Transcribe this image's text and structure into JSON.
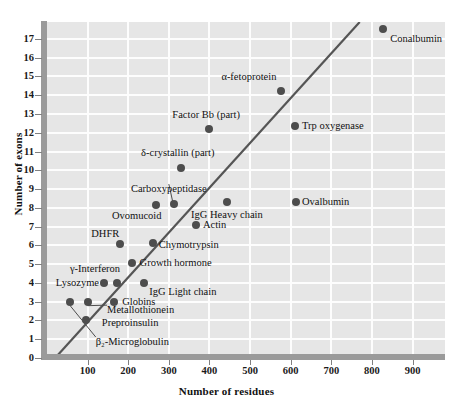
{
  "chart_data": {
    "type": "scatter",
    "title": "",
    "xlabel": "Number of residues",
    "ylabel": "Number of exons",
    "xlim": [
      0,
      980
    ],
    "ylim": [
      0,
      17.9
    ],
    "xticks": [
      100,
      200,
      300,
      400,
      500,
      600,
      700,
      800,
      900
    ],
    "yticks": [
      0,
      1,
      2,
      3,
      4,
      5,
      6,
      7,
      8,
      9,
      10,
      11,
      12,
      13,
      14,
      15,
      16,
      17
    ],
    "grid": true,
    "legend": "none",
    "trendline": {
      "label": "regression line",
      "x0": 20,
      "y0": 0,
      "x1": 770,
      "y1": 17.9
    },
    "points": [
      {
        "name": "β₂-Microglobulin",
        "x": 57,
        "y": 3.0,
        "label_x": 120,
        "label_y": 0.85,
        "anchor": "left",
        "leader": true
      },
      {
        "name": "Preproinsulin",
        "x": 95,
        "y": 2.0,
        "label_x": 135,
        "label_y": 1.85,
        "anchor": "left",
        "leader": false
      },
      {
        "name": "Metallothionein",
        "x": 100,
        "y": 3.0,
        "label_x": 148,
        "label_y": 2.55,
        "anchor": "left",
        "leader": true
      },
      {
        "name": "Globins",
        "x": 165,
        "y": 3.0,
        "label_x": 185,
        "label_y": 3.0,
        "anchor": "left",
        "leader": false
      },
      {
        "name": "Lysozyme",
        "x": 140,
        "y": 4.0,
        "label_x": 128,
        "label_y": 4.0,
        "anchor": "right",
        "leader": false
      },
      {
        "name": "γ-Interferon",
        "x": 172,
        "y": 4.0,
        "label_x": 180,
        "label_y": 4.72,
        "anchor": "right",
        "leader": false
      },
      {
        "name": "IgG Light chain",
        "x": 240,
        "y": 4.0,
        "label_x": 252,
        "label_y": 3.5,
        "anchor": "left",
        "leader": false
      },
      {
        "name": "Growth hormone",
        "x": 210,
        "y": 5.05,
        "label_x": 228,
        "label_y": 5.05,
        "anchor": "left",
        "leader": false
      },
      {
        "name": "DHFR",
        "x": 180,
        "y": 6.05,
        "label_x": 178,
        "label_y": 6.6,
        "anchor": "right",
        "leader": false
      },
      {
        "name": "Chymotrypsin",
        "x": 260,
        "y": 6.1,
        "label_x": 275,
        "label_y": 6.0,
        "anchor": "left",
        "leader": false
      },
      {
        "name": "Actin",
        "x": 368,
        "y": 7.1,
        "label_x": 384,
        "label_y": 7.1,
        "anchor": "left",
        "leader": false
      },
      {
        "name": "Ovomucoid",
        "x": 268,
        "y": 8.15,
        "label_x": 282,
        "label_y": 7.55,
        "anchor": "right",
        "leader": false
      },
      {
        "name": "Carboxypeptidase",
        "x": 313,
        "y": 8.2,
        "label_x": 300,
        "label_y": 9.0,
        "anchor": "center",
        "leader": true
      },
      {
        "name": "IgG Heavy chain",
        "x": 443,
        "y": 8.3,
        "label_x": 443,
        "label_y": 7.6,
        "anchor": "center",
        "leader": false
      },
      {
        "name": "Ovalbumin",
        "x": 612,
        "y": 8.3,
        "label_x": 628,
        "label_y": 8.3,
        "anchor": "left",
        "leader": false
      },
      {
        "name": "δ-crystallin (part)",
        "x": 330,
        "y": 10.1,
        "label_x": 322,
        "label_y": 10.9,
        "anchor": "center",
        "leader": false
      },
      {
        "name": "Factor Bb (part)",
        "x": 400,
        "y": 12.2,
        "label_x": 392,
        "label_y": 12.95,
        "anchor": "center",
        "leader": false
      },
      {
        "name": "Trp oxygenase",
        "x": 610,
        "y": 12.35,
        "label_x": 628,
        "label_y": 12.35,
        "anchor": "left",
        "leader": false
      },
      {
        "name": "α-fetoprotein",
        "x": 577,
        "y": 14.25,
        "label_x": 565,
        "label_y": 14.95,
        "anchor": "right",
        "leader": false
      },
      {
        "name": "Conalbumin",
        "x": 828,
        "y": 17.55,
        "label_x": 845,
        "label_y": 17.0,
        "anchor": "left",
        "leader": false
      }
    ]
  },
  "figure": {
    "background_color": "#ffffff",
    "plot_background_color": "#e6e6e6",
    "grid_color": "#fdfdfd",
    "axis_color": "#9a9a9a",
    "marker_color": "#4d4d4d",
    "line_color": "#555555",
    "text_color": "#111111"
  }
}
